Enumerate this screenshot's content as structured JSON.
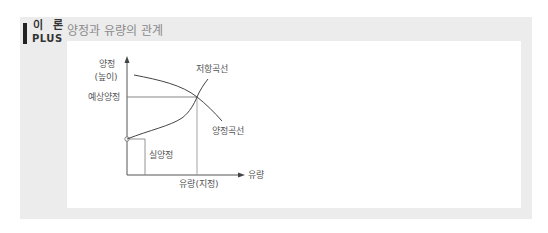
{
  "badge": {
    "line1": "이 론",
    "line2": "PLUS"
  },
  "title": "양정과 유량의 관계",
  "diagram": {
    "y_axis_label_line1": "양정",
    "y_axis_label_line2": "(높이)",
    "x_axis_label": "유량",
    "expected_head_label": "예상양정",
    "resistance_curve_label": "저항곡선",
    "head_curve_label": "양정곡선",
    "actual_head_label": "실양정",
    "specified_flow_label": "유량(지정)"
  },
  "colors": {
    "frame": "#ececec",
    "line": "#555555",
    "title": "#8a8a8a"
  }
}
